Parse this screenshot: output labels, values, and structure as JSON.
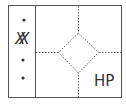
{
  "diagram": {
    "type": "sketch-layout",
    "outer_frame": {
      "x": 8,
      "y": 5,
      "width": 114,
      "height": 93
    },
    "sidebar": {
      "divider_x": 35,
      "items": [
        {
          "kind": "dot",
          "cx": 24,
          "cy": 20
        },
        {
          "kind": "text",
          "label": "XX"
        },
        {
          "kind": "dot",
          "cx": 23,
          "cy": 60
        },
        {
          "kind": "dot",
          "cx": 23,
          "cy": 78
        }
      ]
    },
    "main": {
      "crosshair": {
        "vertical_x": 78,
        "horizontal_y": 52,
        "style": "dashed"
      },
      "diamond": {
        "cx": 78,
        "cy": 52,
        "half_width": 20,
        "half_height": 20,
        "style": "dashed"
      },
      "corner_label": "HP"
    },
    "colors": {
      "stroke": "#555555",
      "dashed": "#666666",
      "background": "#ffffff"
    }
  }
}
